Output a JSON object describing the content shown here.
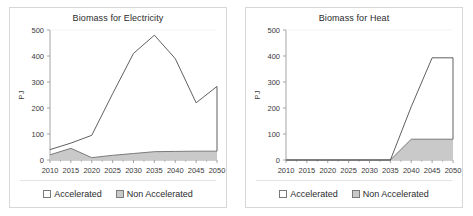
{
  "figure": {
    "panel_count": 2,
    "background": "#ffffff",
    "series_colors": {
      "accelerated_line": "#4d4d4d",
      "non_accelerated_fill": "#c9c9c9",
      "non_accelerated_line": "#6e6e6e",
      "axis": "#9a9a9a",
      "text": "#2b2b2b"
    }
  },
  "legend": {
    "items": [
      {
        "label": "Accelerated",
        "swatch": "white-square",
        "key": "accel"
      },
      {
        "label": "Non Accelerated",
        "swatch": "gray-square",
        "key": "nonaccel"
      }
    ]
  },
  "chart_data": [
    {
      "type": "area",
      "title": "Biomass for Electricity",
      "xlabel": "",
      "ylabel": "PJ",
      "ylim": [
        0,
        500
      ],
      "yticks": [
        0,
        100,
        200,
        300,
        400,
        500
      ],
      "xlim": [
        2010,
        2050
      ],
      "categories": [
        2010,
        2015,
        2020,
        2025,
        2030,
        2035,
        2040,
        2045,
        2050
      ],
      "xticks": [
        "2010",
        "2015",
        "2020",
        "2025",
        "2030",
        "2035",
        "2040",
        "2045",
        "2050"
      ],
      "grid": false,
      "legend_position": "bottom",
      "series": [
        {
          "name": "Accelerated",
          "style": "line",
          "values": [
            40,
            65,
            95,
            255,
            410,
            480,
            390,
            220,
            283
          ]
        },
        {
          "name": "Non Accelerated",
          "style": "filled-area",
          "values": [
            20,
            45,
            9,
            18,
            25,
            32,
            33,
            34,
            34
          ]
        }
      ]
    },
    {
      "type": "area",
      "title": "Biomass for Heat",
      "xlabel": "",
      "ylabel": "PJ",
      "ylim": [
        0,
        500
      ],
      "yticks": [
        0,
        100,
        200,
        300,
        400,
        500
      ],
      "xlim": [
        2010,
        2050
      ],
      "categories": [
        2010,
        2015,
        2020,
        2025,
        2030,
        2035,
        2040,
        2045,
        2050
      ],
      "xticks": [
        "2010",
        "2015",
        "2020",
        "2025",
        "2030",
        "2035",
        "2040",
        "2045",
        "2050"
      ],
      "grid": false,
      "legend_position": "bottom",
      "series": [
        {
          "name": "Accelerated",
          "style": "line",
          "values": [
            0,
            0,
            0,
            0,
            0,
            0,
            205,
            393,
            393
          ]
        },
        {
          "name": "Non Accelerated",
          "style": "filled-area",
          "values": [
            0,
            0,
            0,
            0,
            0,
            0,
            80,
            80,
            80
          ]
        }
      ]
    }
  ]
}
